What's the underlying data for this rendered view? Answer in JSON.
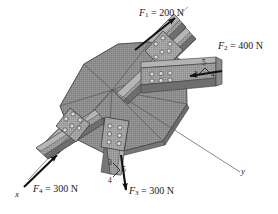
{
  "figure": {
    "width": 278,
    "height": 214
  },
  "colors": {
    "plate_fill": "#8d8d8d",
    "plate_dark": "#6f6f6f",
    "plate_light": "#a6a6a6",
    "beam_fill": "#9a9a9a",
    "beam_shade": "#747474",
    "beam_highlight": "#b8b8b8",
    "bolt_plate": "#9e9e9e",
    "bolt": "#d8d8d8",
    "bolt_ring": "#5a5a5a",
    "outline": "#3a3a3a",
    "arrow": "#111111",
    "axis_line": "#555555",
    "text": "#1a1a1a",
    "background": "#ffffff"
  },
  "forces": [
    {
      "id": "F1",
      "symbol": "F",
      "subscript": "1",
      "equals": "=",
      "magnitude": "200",
      "unit": "N",
      "label": "F1 = 200 N",
      "direction": "up-and-right along upper member",
      "has_slope_triangle": false
    },
    {
      "id": "F2",
      "symbol": "F",
      "subscript": "2",
      "equals": "=",
      "magnitude": "400",
      "unit": "N",
      "label": "F2 = 400 N",
      "direction": "left along horizontal channel member",
      "has_slope_triangle": true,
      "slope": {
        "vertical": "3",
        "horizontal": "4",
        "hypotenuse": "5"
      }
    },
    {
      "id": "F3",
      "symbol": "F",
      "subscript": "3",
      "equals": "=",
      "magnitude": "300",
      "unit": "N",
      "label": "F3 = 300 N",
      "direction": "downward along lower member",
      "has_slope_triangle": true,
      "slope": {
        "vertical": "3",
        "horizontal": "4",
        "hypotenuse": "5"
      }
    },
    {
      "id": "F4",
      "symbol": "F",
      "subscript": "4",
      "equals": "=",
      "magnitude": "300",
      "unit": "N",
      "label": "F4 = 300 N",
      "direction": "up-and-right along lower-left member",
      "has_slope_triangle": false
    }
  ],
  "axes": [
    {
      "id": "x-axis",
      "label": "x",
      "direction": "toward lower left"
    },
    {
      "id": "y-axis",
      "label": "y",
      "direction": "toward lower right"
    }
  ],
  "members": [
    {
      "id": "member-upper-left",
      "bolts": 6,
      "bolt_rows": 2,
      "bolt_cols": 3
    },
    {
      "id": "member-right-channel",
      "bolts": 6,
      "bolt_rows": 2,
      "bolt_cols": 3
    },
    {
      "id": "member-lower-left",
      "bolts": 6,
      "bolt_rows": 2,
      "bolt_cols": 3
    },
    {
      "id": "member-bottom",
      "bolts": 6,
      "bolt_rows": 3,
      "bolt_cols": 2
    }
  ]
}
